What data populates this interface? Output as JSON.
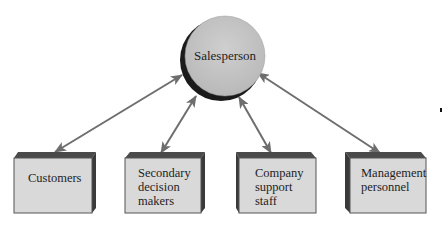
{
  "diagram": {
    "type": "hub-and-spoke relationship diagram",
    "center": {
      "label": "Salesperson"
    },
    "nodes": [
      {
        "label_lines": [
          "Customers"
        ]
      },
      {
        "label_lines": [
          "Secondary",
          "decision",
          "makers"
        ]
      },
      {
        "label_lines": [
          "Company",
          "support",
          "staff"
        ]
      },
      {
        "label_lines": [
          "Management",
          "personnel"
        ]
      }
    ],
    "edges": [
      {
        "from": "Salesperson",
        "to": "Customers",
        "direction": "bidirectional"
      },
      {
        "from": "Salesperson",
        "to": "Secondary decision makers",
        "direction": "bidirectional"
      },
      {
        "from": "Salesperson",
        "to": "Company support staff",
        "direction": "bidirectional"
      },
      {
        "from": "Salesperson",
        "to": "Management personnel",
        "direction": "bidirectional"
      }
    ],
    "colors": {
      "circle_fill": "#c4c4c4",
      "circle_shadow": "#1a1a1a",
      "box_face": "#d9d9d9",
      "box_edge": "#444444",
      "arrow": "#6e6e6e"
    }
  }
}
